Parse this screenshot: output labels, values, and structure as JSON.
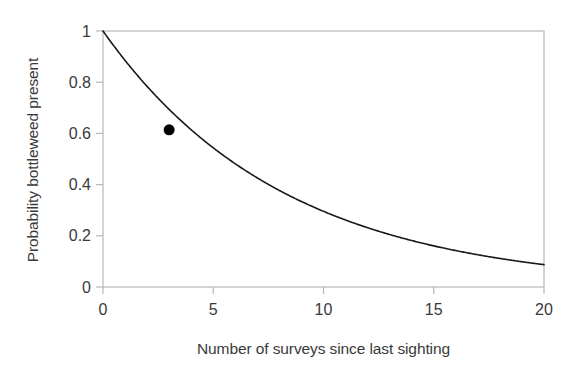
{
  "chart_data": {
    "type": "line",
    "title": "",
    "subtitle": "",
    "xlabel": "Number of surveys since last sighting",
    "ylabel": "Probability bottleweed present",
    "xlim": [
      0,
      20
    ],
    "ylim": [
      0,
      1
    ],
    "xticks": [
      0,
      5,
      10,
      15,
      20
    ],
    "xticklabels": [
      "0",
      "5",
      "10",
      "15",
      "20"
    ],
    "yticks": [
      0,
      0.2,
      0.4,
      0.6,
      0.8,
      1
    ],
    "yticklabels": [
      "0",
      "0.2",
      "0.4",
      "0.6",
      "0.8",
      "1"
    ],
    "grid": false,
    "legend": null,
    "legend_position": "none",
    "line_color": "#1a1a1a",
    "line_width": 1.6,
    "axis_color": "#b8b8b8",
    "series": [
      {
        "name": "Probability bottleweed present",
        "kind": "exponential-decay",
        "decay_rate": 0.1219,
        "x": [
          0,
          1,
          2,
          3,
          4,
          5,
          6,
          7,
          8,
          9,
          10,
          11,
          12,
          13,
          14,
          15,
          16,
          17,
          18,
          19,
          20
        ],
        "values": [
          1.0,
          0.885,
          0.783,
          0.694,
          0.614,
          0.543,
          0.481,
          0.426,
          0.377,
          0.334,
          0.295,
          0.261,
          0.231,
          0.205,
          0.181,
          0.16,
          0.142,
          0.126,
          0.111,
          0.098,
          0.087
        ]
      }
    ],
    "annotations": [
      {
        "name": "highlighted-point",
        "x": 3,
        "y": 0.614,
        "marker": "filled-circle",
        "marker_color": "#000000",
        "marker_size": 11
      }
    ]
  },
  "axis": {
    "x_title": "Number of surveys since last sighting",
    "y_title": "Probability bottleweed present"
  }
}
